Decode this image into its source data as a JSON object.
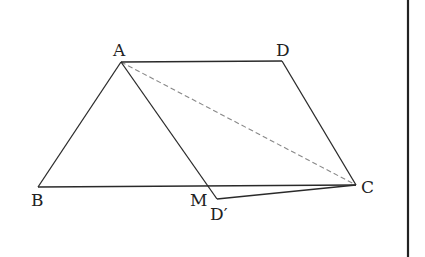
{
  "figure": {
    "type": "geometry",
    "points": {
      "A": {
        "label": "A",
        "x": 121,
        "y": 62
      },
      "D": {
        "label": "D",
        "x": 282,
        "y": 61
      },
      "B": {
        "label": "B",
        "x": 38,
        "y": 187
      },
      "C": {
        "label": "C",
        "x": 356,
        "y": 185
      },
      "M": {
        "label": "M",
        "x": 208,
        "y": 186
      },
      "Dp": {
        "label": "D′",
        "x": 217,
        "y": 199
      }
    },
    "solid_segments": [
      "AD",
      "DC",
      "AB",
      "BC",
      "AM",
      "MD′",
      "D′C"
    ],
    "dashed_segments": [
      "AC"
    ]
  },
  "labels": {
    "A": "A",
    "D": "D",
    "B": "B",
    "C": "C",
    "M": "M",
    "Dp": "D′"
  }
}
